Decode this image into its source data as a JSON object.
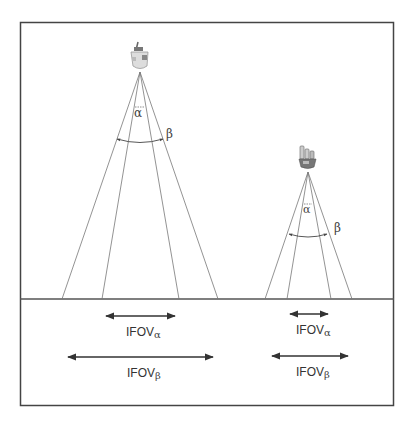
{
  "diagram": {
    "left_sensor": {
      "angle_small_label": "α",
      "angle_large_label": "β",
      "ifov_alpha_label": "IFOV",
      "ifov_alpha_sub": "α",
      "ifov_beta_label": "IFOV",
      "ifov_beta_sub": "β"
    },
    "right_sensor": {
      "angle_small_label": "α",
      "angle_large_label": "β",
      "ifov_alpha_label": "IFOV",
      "ifov_alpha_sub": "α",
      "ifov_beta_label": "IFOV",
      "ifov_beta_sub": "β"
    },
    "colors": {
      "frame": "#444444",
      "rays": "#666666",
      "arrows": "#333333"
    }
  }
}
